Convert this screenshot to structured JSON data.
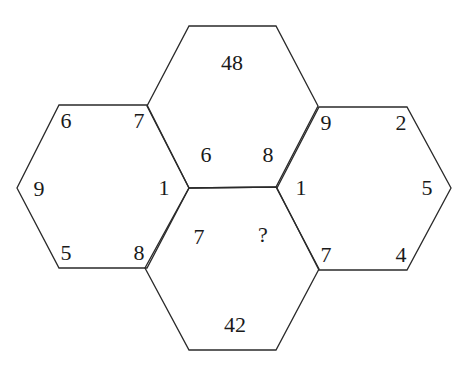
{
  "puzzle": {
    "top": {
      "center": "48",
      "bottom_left": "6",
      "bottom_right": "8"
    },
    "left": {
      "top_left": "6",
      "top_right": "7",
      "left": "9",
      "right": "1",
      "bottom_left": "5",
      "bottom_right": "8"
    },
    "right": {
      "top_left": "9",
      "top_right": "2",
      "left": "1",
      "right": "5",
      "bottom_left": "7",
      "bottom_right": "4"
    },
    "bottom": {
      "top_left": "7",
      "top_right": "?",
      "center": "42"
    }
  }
}
